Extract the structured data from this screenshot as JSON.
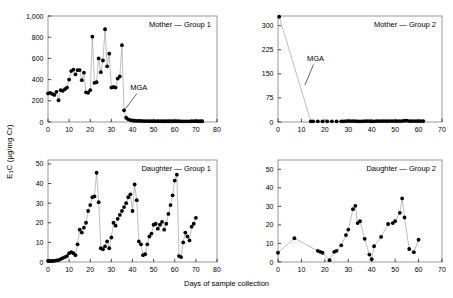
{
  "figure": {
    "xlabel": "Days of sample collection",
    "ylabel_main": "E",
    "ylabel_sub": "1",
    "ylabel_rest": "C (µg/mg Cr)"
  },
  "chart_data": [
    {
      "type": "line",
      "panel_id": "mother-group-1",
      "title": "Mother — Group 1",
      "xlabel": "Days of sample collection",
      "ylabel": "E1C (µg/mg Cr)",
      "xlim": [
        0,
        80
      ],
      "ylim": [
        0,
        1000
      ],
      "xticks": [
        0,
        10,
        20,
        30,
        40,
        50,
        60,
        70,
        80
      ],
      "yticks": [
        0,
        200,
        400,
        600,
        800,
        1000
      ],
      "ytick_labels": [
        "0",
        "200",
        "400",
        "600",
        "800",
        "1,000"
      ],
      "grid": false,
      "marker": "filled-circle",
      "annotations": [
        {
          "text": "MGA",
          "x": 43,
          "y": 300,
          "leader_to_x": 36.5,
          "leader_to_y": 120
        }
      ],
      "x": [
        0,
        1,
        2,
        3,
        4,
        5,
        6,
        7,
        8,
        9,
        10,
        11,
        12,
        13,
        14,
        15,
        16,
        17,
        18,
        19,
        20,
        21,
        22,
        23,
        24,
        25,
        26,
        27,
        28,
        29,
        30,
        31,
        32,
        33,
        34,
        35,
        36,
        37,
        38,
        39,
        40,
        41,
        42,
        43,
        44,
        45,
        46,
        47,
        48,
        49,
        50,
        51,
        52,
        53,
        54,
        55,
        56,
        57,
        58,
        59,
        60,
        61,
        62,
        63,
        64,
        65,
        66,
        67,
        68,
        69,
        70,
        71,
        72,
        73
      ],
      "y": [
        270,
        275,
        265,
        255,
        285,
        205,
        300,
        295,
        310,
        325,
        400,
        480,
        495,
        450,
        490,
        490,
        395,
        465,
        280,
        275,
        300,
        805,
        370,
        375,
        600,
        470,
        580,
        875,
        525,
        645,
        325,
        330,
        325,
        410,
        430,
        725,
        110,
        40,
        25,
        18,
        14,
        12,
        11,
        10,
        10,
        9,
        9,
        9,
        8,
        8,
        8,
        8,
        8,
        8,
        7,
        7,
        7,
        7,
        7,
        7,
        7,
        7,
        7,
        6,
        6,
        6,
        6,
        6,
        8,
        8,
        8,
        7,
        7,
        7
      ]
    },
    {
      "type": "line",
      "panel_id": "mother-group-2",
      "title": "Mother — Group 2",
      "xlabel": "Days of sample collection",
      "ylabel": "E1C (µg/mg Cr)",
      "xlim": [
        0,
        70
      ],
      "ylim": [
        0,
        330
      ],
      "xticks": [
        0,
        10,
        20,
        30,
        40,
        50,
        60,
        70
      ],
      "yticks": [
        0,
        75,
        150,
        225,
        300
      ],
      "ytick_labels": [
        "0",
        "75",
        "150",
        "225",
        "300"
      ],
      "grid": false,
      "marker": "filled-circle",
      "annotations": [
        {
          "text": "MGA",
          "x": 16,
          "y": 190,
          "leader_to_x": 11.5,
          "leader_to_y": 115
        }
      ],
      "x": [
        0.5,
        14,
        15,
        17,
        19,
        21,
        23,
        25,
        27,
        28,
        29,
        30,
        31,
        32,
        33,
        34,
        35,
        36,
        37,
        38,
        39,
        40,
        41,
        42,
        43,
        44,
        45,
        46,
        47,
        48,
        49,
        50,
        51,
        52,
        53,
        54,
        55,
        56,
        57,
        58,
        59,
        60,
        61,
        62
      ],
      "y": [
        328,
        2,
        2,
        2,
        2,
        2,
        2,
        2,
        2,
        2,
        3,
        3,
        3,
        3,
        3,
        2,
        2,
        2,
        3,
        3,
        3,
        2,
        2,
        3,
        3,
        3,
        3,
        3,
        3,
        3,
        3,
        3,
        3,
        3,
        3,
        4,
        4,
        3,
        3,
        3,
        3,
        3,
        3,
        3
      ]
    },
    {
      "type": "line",
      "panel_id": "daughter-group-1",
      "title": "Daughter — Group 1",
      "xlabel": "Days of sample collection",
      "ylabel": "E1C (µg/mg Cr)",
      "xlim": [
        0,
        80
      ],
      "ylim": [
        0,
        52
      ],
      "xticks": [
        0,
        10,
        20,
        30,
        40,
        50,
        60,
        70,
        80
      ],
      "yticks": [
        0,
        10,
        20,
        30,
        40,
        50
      ],
      "ytick_labels": [
        "0",
        "10",
        "20",
        "30",
        "40",
        "50"
      ],
      "grid": false,
      "marker": "filled-circle",
      "annotations": [],
      "x": [
        0,
        1,
        2,
        3,
        4,
        5,
        6,
        7,
        8,
        9,
        10,
        11,
        12,
        13,
        14,
        15,
        16,
        17,
        18,
        19,
        20,
        21,
        22,
        23,
        24,
        25,
        26,
        27,
        28,
        29,
        30,
        31,
        32,
        33,
        34,
        35,
        36,
        37,
        38,
        39,
        40,
        41,
        42,
        43,
        44,
        45,
        46,
        47,
        48,
        49,
        50,
        51,
        52,
        53,
        54,
        55,
        56,
        57,
        58,
        59,
        60,
        61,
        62,
        63,
        64,
        65,
        66,
        67,
        68,
        69,
        70
      ],
      "y": [
        0.5,
        0.5,
        0.5,
        0.6,
        0.8,
        1.0,
        1.5,
        2.0,
        2.5,
        3.0,
        4.5,
        5.0,
        4.5,
        3.5,
        9.0,
        16.5,
        15.0,
        17.5,
        20.0,
        26.0,
        29.0,
        33.0,
        33.5,
        45.5,
        30.5,
        7.0,
        6.5,
        8.0,
        10.5,
        7.0,
        12.5,
        20.0,
        18.5,
        22.0,
        24.0,
        26.0,
        28.0,
        30.0,
        33.0,
        34.5,
        26.0,
        39.5,
        31.5,
        10.5,
        9.0,
        3.5,
        4.0,
        9.0,
        13.0,
        14.5,
        19.0,
        19.5,
        17.0,
        19.0,
        20.5,
        16.5,
        19.5,
        24.5,
        29.0,
        34.0,
        41.5,
        44.5,
        3.0,
        2.5,
        10.0,
        15.0,
        13.0,
        11.0,
        18.0,
        19.5,
        22.5
      ]
    },
    {
      "type": "line",
      "panel_id": "daughter-group-2",
      "title": "Daughter — Group 2",
      "xlabel": "Days of sample collection",
      "ylabel": "E1C (µg/mg Cr)",
      "xlim": [
        0,
        70
      ],
      "ylim": [
        0,
        55
      ],
      "xticks": [
        0,
        10,
        20,
        30,
        40,
        50,
        60,
        70
      ],
      "yticks": [
        0,
        10,
        20,
        30,
        40,
        50
      ],
      "ytick_labels": [
        "0",
        "10",
        "20",
        "30",
        "40",
        "50"
      ],
      "grid": false,
      "marker": "filled-circle",
      "annotations": [],
      "x": [
        0,
        7,
        17,
        18,
        19,
        22,
        24,
        25,
        27,
        29,
        30,
        32,
        33,
        34,
        35,
        37,
        39,
        40,
        41,
        44,
        47,
        49,
        50,
        52,
        53,
        54,
        56,
        58,
        60
      ],
      "y": [
        5.0,
        12.8,
        6.0,
        5.5,
        5.0,
        1.0,
        5.5,
        6.0,
        9.0,
        14.5,
        17.5,
        28.5,
        30.3,
        21.0,
        22.0,
        12.5,
        4.0,
        1.5,
        8.5,
        13.5,
        20.5,
        21.0,
        22.0,
        26.5,
        34.3,
        24.0,
        7.0,
        5.3,
        12.0
      ]
    }
  ]
}
